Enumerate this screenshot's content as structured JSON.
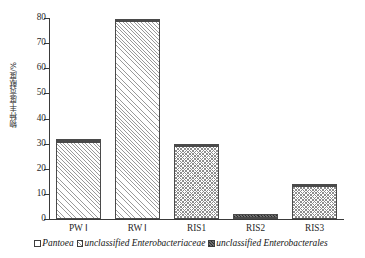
{
  "chart_data": {
    "type": "bar",
    "stacked": true,
    "title": "",
    "xlabel": "",
    "ylabel": "物种丰度贡献度/%",
    "ylim": [
      0,
      80
    ],
    "yticks": [
      0,
      10,
      20,
      30,
      40,
      50,
      60,
      70,
      80
    ],
    "ytick_labels": [
      "0",
      "10",
      "20",
      "30",
      "40",
      "50",
      "60",
      "70",
      "80"
    ],
    "grid": false,
    "legend_position": "bottom",
    "categories": [
      "PW Ⅰ",
      "RW Ⅰ",
      "RIS1",
      "RIS2",
      "RIS3"
    ],
    "series": [
      {
        "name": "Pantoea",
        "pattern": "diagonal-hatch",
        "color": "#ffffff",
        "values": [
          30.6,
          78.9,
          0.0,
          0.0,
          0.0
        ]
      },
      {
        "name": "unclassified Enterobacteriaceae",
        "pattern": "crosshatch",
        "color": "#e8e8e8",
        "values": [
          0.5,
          0.0,
          29.0,
          0.3,
          13.2
        ]
      },
      {
        "name": "unclassified Enterobacterales",
        "pattern": "dark-fill",
        "color": "#4f4f4f",
        "values": [
          0.3,
          0.7,
          0.6,
          1.6,
          0.9
        ]
      }
    ],
    "totals": [
      31.4,
      79.6,
      29.6,
      1.9,
      14.1
    ]
  },
  "axis": {
    "y_title": "物种丰度贡献度/%",
    "y_tick_labels": [
      "80",
      "70",
      "60",
      "50",
      "40",
      "30",
      "20",
      "10",
      "0"
    ],
    "x_tick_labels": [
      "PW Ⅰ",
      "RW Ⅰ",
      "RIS1",
      "RIS2",
      "RIS3"
    ]
  },
  "legend": {
    "items": [
      {
        "label": "Pantoea",
        "swatch": "white-square-icon"
      },
      {
        "label": "unclassified Enterobacteriaceae",
        "swatch": "hatched-square-icon"
      },
      {
        "label": "unclassified Enterobacterales",
        "swatch": "dark-square-icon"
      }
    ]
  }
}
